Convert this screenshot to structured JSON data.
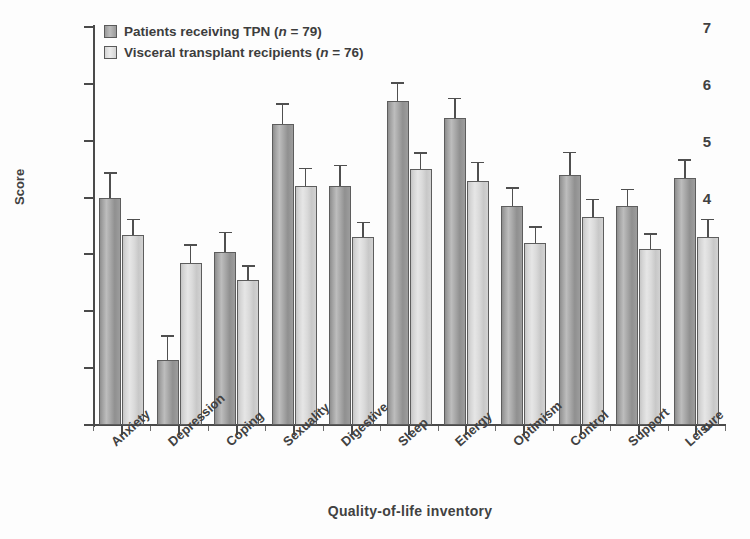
{
  "chart_data": {
    "type": "bar",
    "title": "",
    "xlabel": "Quality-of-life inventory",
    "ylabel": "Score",
    "ylim": [
      0,
      7
    ],
    "ytick_labels": [
      "0",
      "1",
      "2",
      "3",
      "4",
      "5",
      "6",
      "7"
    ],
    "grid": false,
    "legend_position": "top-left",
    "categories": [
      "Anxiety",
      "Depression",
      "Coping",
      "Sexuality",
      "Digestive",
      "Sleep",
      "Energy",
      "Optimism",
      "Control",
      "Support",
      "Leisure"
    ],
    "series": [
      {
        "name": "Patients receiving TPN (n = 79)",
        "color": "#a4a4a4",
        "values": [
          4.0,
          1.15,
          3.05,
          5.3,
          4.2,
          5.7,
          5.4,
          3.85,
          4.4,
          3.85,
          4.35
        ],
        "errors": [
          0.42,
          0.4,
          0.32,
          0.33,
          0.35,
          0.3,
          0.33,
          0.3,
          0.38,
          0.28,
          0.3
        ]
      },
      {
        "name": "Visceral transplant recipients (n = 76)",
        "color": "#dcdcdc",
        "values": [
          3.35,
          2.85,
          2.55,
          4.2,
          3.3,
          4.5,
          4.3,
          3.2,
          3.65,
          3.1,
          3.3
        ],
        "errors": [
          0.25,
          0.3,
          0.23,
          0.3,
          0.25,
          0.27,
          0.3,
          0.27,
          0.3,
          0.25,
          0.3
        ]
      }
    ]
  },
  "legend": {
    "entries": [
      {
        "label_main": "Patients receiving TPN (",
        "label_n": "n",
        "label_tail": " = 79)"
      },
      {
        "label_main": "Visceral transplant recipients (",
        "label_n": "n",
        "label_tail": " = 76)"
      }
    ]
  },
  "axes": {
    "y_title": "Score",
    "x_title": "Quality-of-life inventory"
  }
}
